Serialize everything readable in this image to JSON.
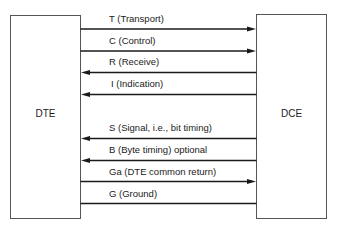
{
  "diagram": {
    "type": "interface-signal-diagram",
    "left_box": {
      "label": "DTE"
    },
    "right_box": {
      "label": "DCE"
    },
    "signals": [
      {
        "label": "T (Transport)",
        "direction": "DTE->DCE"
      },
      {
        "label": "C (Control)",
        "direction": "DTE->DCE"
      },
      {
        "label": "R (Receive)",
        "direction": "DCE->DTE"
      },
      {
        "label": "I (Indication)",
        "direction": "DCE->DTE"
      },
      {
        "label": "S (Signal, i.e., bit timing)",
        "direction": "DCE->DTE"
      },
      {
        "label": "B (Byte timing) optional",
        "direction": "DCE->DTE"
      },
      {
        "label": "Ga (DTE common return)",
        "direction": "DTE->DCE"
      },
      {
        "label": "G (Ground)",
        "direction": "none"
      }
    ]
  }
}
